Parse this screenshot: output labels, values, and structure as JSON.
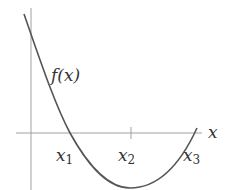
{
  "diagram": {
    "type": "function-plot",
    "function_label": "f(x)",
    "axis_label_x": "x",
    "roots": [
      {
        "name": "x",
        "sub": "1"
      },
      {
        "name": "x",
        "sub": "3"
      }
    ],
    "marked_point": {
      "name": "x",
      "sub": "2"
    },
    "colors": {
      "axis": "#9a9a9a",
      "curve": "#555555",
      "text": "#333333"
    }
  }
}
